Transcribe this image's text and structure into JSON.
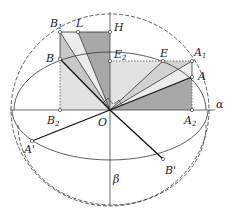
{
  "diagram": {
    "type": "geometric-projection",
    "origin": {
      "label": "O",
      "x": 110,
      "y": 110
    },
    "axes": {
      "alpha": "α",
      "beta": "β"
    },
    "points": [
      {
        "id": "B1",
        "label": "B",
        "sub": "1",
        "x": 60,
        "y": 32
      },
      {
        "id": "L",
        "label": "L",
        "sub": "",
        "x": 78,
        "y": 32
      },
      {
        "id": "H",
        "label": "H",
        "sub": "",
        "x": 110,
        "y": 32
      },
      {
        "id": "B",
        "label": "B",
        "sub": "",
        "x": 60,
        "y": 59
      },
      {
        "id": "E2",
        "label": "E",
        "sub": "2",
        "x": 110,
        "y": 61
      },
      {
        "id": "E",
        "label": "E",
        "sub": "",
        "x": 163,
        "y": 61
      },
      {
        "id": "A1",
        "label": "A",
        "sub": "1",
        "x": 192,
        "y": 61
      },
      {
        "id": "A",
        "label": "A",
        "sub": "",
        "x": 192,
        "y": 77
      },
      {
        "id": "B2",
        "label": "B",
        "sub": "2",
        "x": 60,
        "y": 110
      },
      {
        "id": "A2",
        "label": "A",
        "sub": "2",
        "x": 192,
        "y": 110
      },
      {
        "id": "A'",
        "label": "A'",
        "sub": "",
        "x": 32,
        "y": 141
      },
      {
        "id": "B'",
        "label": "B'",
        "sub": "",
        "x": 163,
        "y": 159
      }
    ],
    "labels": {
      "B1": "B",
      "B1_sub": "1",
      "L": "L",
      "H": "H",
      "B": "B",
      "E2": "E",
      "E2_sub": "2",
      "E": "E",
      "A1": "A",
      "A1_sub": "1",
      "A": "A",
      "B2": "B",
      "B2_sub": "2",
      "O": "O",
      "A2": "A",
      "A2_sub": "2",
      "alpha": "α",
      "Aprime": "A'",
      "Bprime": "B'",
      "beta": "β"
    },
    "colors": {
      "dark_fill": "#a6a6a6",
      "mid_fill": "#c9c9c9",
      "light_fill": "#e4e4e4",
      "line": "#222222"
    }
  }
}
